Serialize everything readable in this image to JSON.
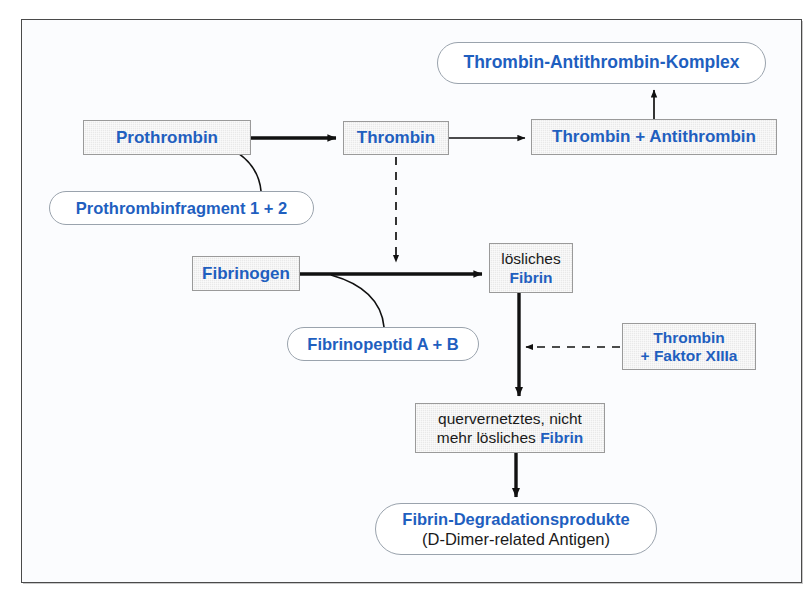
{
  "diagram": {
    "colors": {
      "accent_blue": "#1f5fbf",
      "box_fill": "#e9e9e9",
      "box_border": "#9a9a9a",
      "oval_border": "#9aa3ad",
      "frame_border": "#4a4a4a",
      "text_black": "#1a1a1a",
      "canvas": "#fbfcfe"
    },
    "nodes": {
      "prothrombin": {
        "shape": "box",
        "label": "Prothrombin"
      },
      "thrombin": {
        "shape": "box",
        "label": "Thrombin"
      },
      "thrombin_antithrombin": {
        "shape": "box",
        "label": "Thrombin + Antithrombin"
      },
      "tat_komplex": {
        "shape": "oval",
        "label": "Thrombin-Antithrombin-Komplex"
      },
      "prothrombinfragment": {
        "shape": "oval",
        "label": "Prothrombinfragment 1 + 2"
      },
      "fibrinogen": {
        "shape": "box",
        "label": "Fibrinogen"
      },
      "loesliches_fibrin": {
        "shape": "box",
        "line1": "lösliches",
        "line2": "Fibrin"
      },
      "fibrinopeptid": {
        "shape": "oval",
        "label": "Fibrinopeptid A + B"
      },
      "thrombin_faktor_xiiia": {
        "shape": "box",
        "line1": "Thrombin",
        "line2": "+ Faktor XIIIa"
      },
      "quervernetztes_fibrin": {
        "shape": "box",
        "line1": "quervernetztes, nicht",
        "line2a": "mehr lösliches ",
        "line2b": "Fibrin"
      },
      "fibrin_degradationsprodukte": {
        "shape": "oval",
        "line1": "Fibrin-Degradationsprodukte",
        "line2": "(D-Dimer-related Antigen)"
      }
    },
    "edges": [
      {
        "from": "prothrombin",
        "to": "thrombin",
        "style": "solid-arrow"
      },
      {
        "from": "thrombin",
        "to": "thrombin_antithrombin",
        "style": "solid-arrow"
      },
      {
        "from": "thrombin_antithrombin",
        "to": "tat_komplex",
        "style": "solid-arrow"
      },
      {
        "from": "prothrombinfragment",
        "to": "prothrombin-thrombin-edge",
        "style": "curve"
      },
      {
        "from": "thrombin",
        "to": "fibrinogen-fibrin-edge",
        "style": "dashed-arrow"
      },
      {
        "from": "fibrinogen",
        "to": "loesliches_fibrin",
        "style": "solid-arrow"
      },
      {
        "from": "fibrinopeptid",
        "to": "fibrinogen-fibrin-edge",
        "style": "curve"
      },
      {
        "from": "thrombin_faktor_xiiia",
        "to": "fibrin-crosslink-edge",
        "style": "dashed-arrow"
      },
      {
        "from": "loesliches_fibrin",
        "to": "quervernetztes_fibrin",
        "style": "solid-arrow"
      },
      {
        "from": "quervernetztes_fibrin",
        "to": "fibrin_degradationsprodukte",
        "style": "solid-arrow"
      }
    ]
  }
}
